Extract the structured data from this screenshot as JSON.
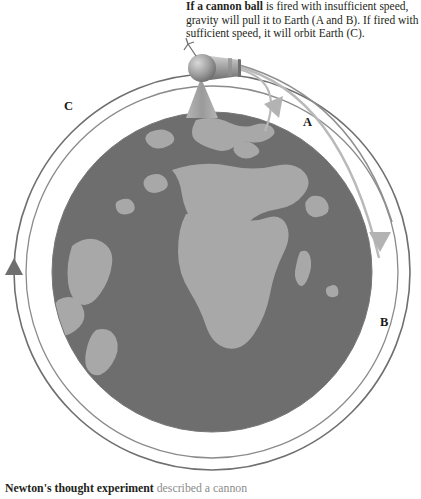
{
  "caption_top": {
    "lead": "If a cannon ball",
    "rest": " is fired with insufficient speed, gravity will pull it to Earth (A and B). If fired with sufficient speed, it will orbit Earth (C)."
  },
  "caption_bottom": {
    "lead": "Newton's thought experiment",
    "rest": " described a cannon"
  },
  "labels": {
    "a": "A",
    "b": "B",
    "c": "C"
  },
  "icons": {
    "cannon": "cannon-icon",
    "globe": "globe-icon",
    "spark": "spark-icon",
    "arrow_a": "arrow-head-a-icon",
    "arrow_b": "arrow-head-b-icon",
    "arrow_c": "arrow-head-c-icon"
  },
  "colors": {
    "ocean": "#6e6e6e",
    "land": "#a8a8a8",
    "orbit_line": "#6f6f6f",
    "trajectory_light": "#b3b3b3",
    "trajectory_mid": "#9a9a9a",
    "cannon_body": "#8d8d8d",
    "text": "#231f20",
    "muted_text": "#8c8c8c",
    "background": "#ffffff"
  },
  "geometry": {
    "globe_center_x": 212,
    "globe_center_y": 272,
    "globe_radius": 160,
    "orbit_outer_radius": 198,
    "orbit_inner_radius": 186
  }
}
